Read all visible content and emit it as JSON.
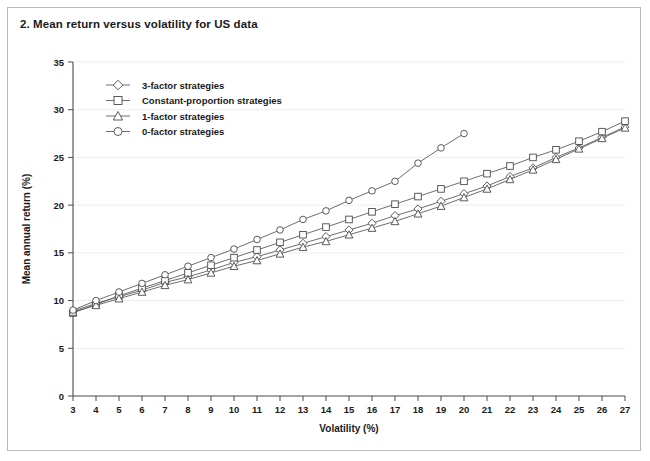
{
  "figure": {
    "title": "2. Mean return versus volatility for US data"
  },
  "chart_data": {
    "type": "line",
    "title": "2. Mean return versus volatility for US data",
    "xlabel": "Volatility (%)",
    "ylabel": "Mean annual return (%)",
    "xlim": [
      3,
      27
    ],
    "ylim": [
      0,
      35
    ],
    "xticks": [
      3,
      4,
      5,
      6,
      7,
      8,
      9,
      10,
      11,
      12,
      13,
      14,
      15,
      16,
      17,
      18,
      19,
      20,
      21,
      22,
      23,
      24,
      25,
      26,
      27
    ],
    "yticks": [
      0,
      5,
      10,
      15,
      20,
      25,
      30,
      35
    ],
    "grid": true,
    "legend_position": "top-left",
    "series": [
      {
        "name": "3-factor strategies",
        "marker": "diamond",
        "x": [
          3,
          4,
          5,
          6,
          7,
          8,
          9,
          10,
          11,
          12,
          13,
          14,
          15,
          16,
          17,
          18,
          19,
          20,
          21,
          22,
          23,
          24,
          25,
          26,
          27
        ],
        "y": [
          8.9,
          9.7,
          10.4,
          11.1,
          11.9,
          12.5,
          13.2,
          14.0,
          14.6,
          15.3,
          16.0,
          16.7,
          17.4,
          18.1,
          18.9,
          19.6,
          20.4,
          21.2,
          22.0,
          23.0,
          23.9,
          25.0,
          26.0,
          27.1,
          28.2
        ]
      },
      {
        "name": "Constant-proportion strategies",
        "marker": "square",
        "x": [
          3,
          4,
          5,
          6,
          7,
          8,
          9,
          10,
          11,
          12,
          13,
          14,
          15,
          16,
          17,
          18,
          19,
          20,
          21,
          22,
          23,
          24,
          25,
          26,
          27
        ],
        "y": [
          8.7,
          9.6,
          10.5,
          11.3,
          12.1,
          12.9,
          13.7,
          14.5,
          15.3,
          16.1,
          16.9,
          17.7,
          18.5,
          19.3,
          20.1,
          20.9,
          21.7,
          22.5,
          23.3,
          24.1,
          25.0,
          25.8,
          26.7,
          27.7,
          28.8
        ]
      },
      {
        "name": "1-factor strategies",
        "marker": "triangle",
        "x": [
          3,
          4,
          5,
          6,
          7,
          8,
          9,
          10,
          11,
          12,
          13,
          14,
          15,
          16,
          17,
          18,
          19,
          20,
          21,
          22,
          23,
          24,
          25,
          26,
          27
        ],
        "y": [
          8.8,
          9.5,
          10.2,
          10.9,
          11.6,
          12.2,
          12.9,
          13.6,
          14.2,
          14.9,
          15.6,
          16.2,
          16.9,
          17.6,
          18.3,
          19.1,
          19.9,
          20.8,
          21.7,
          22.7,
          23.7,
          24.8,
          25.9,
          27.0,
          28.1
        ]
      },
      {
        "name": "0-factor strategies",
        "marker": "circle",
        "x": [
          3,
          4,
          5,
          6,
          7,
          8,
          9,
          10,
          11,
          12,
          13,
          14,
          15,
          16,
          17,
          18,
          19,
          20
        ],
        "y": [
          9.0,
          10.0,
          10.9,
          11.8,
          12.7,
          13.6,
          14.5,
          15.4,
          16.4,
          17.4,
          18.5,
          19.4,
          20.5,
          21.5,
          22.5,
          24.4,
          26.0,
          27.5
        ]
      }
    ]
  },
  "legend": {
    "items": [
      {
        "label": "3-factor strategies",
        "marker": "diamond"
      },
      {
        "label": "Constant-proportion strategies",
        "marker": "square"
      },
      {
        "label": "1-factor strategies",
        "marker": "triangle"
      },
      {
        "label": "0-factor strategies",
        "marker": "circle"
      }
    ]
  }
}
